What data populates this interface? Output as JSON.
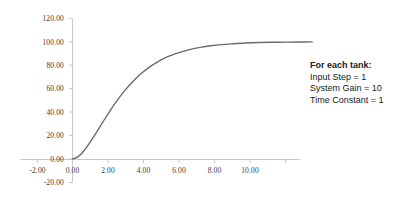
{
  "chart_data": {
    "type": "line",
    "title": "",
    "subtitle": "",
    "xlabel": "",
    "ylabel": "",
    "xlim": [
      -2.0,
      10.0
    ],
    "ylim": [
      -20.0,
      120.0
    ],
    "grid": false,
    "legend": null,
    "x_ticks": [
      -2.0,
      0.0,
      2.0,
      4.0,
      6.0,
      8.0,
      10.0
    ],
    "x_tick_labels": [
      "-2.00",
      "0.00",
      "2.00",
      "4.00",
      "6.00",
      "8.00",
      "10.00"
    ],
    "y_ticks": [
      -20.0,
      0.0,
      20.0,
      40.0,
      60.0,
      80.0,
      100.0,
      120.0
    ],
    "y_tick_labels": [
      "-20.00",
      "0.00",
      "20.00",
      "40.00",
      "60.00",
      "80.00",
      "100.00",
      "120.00"
    ],
    "series": [
      {
        "name": "step response",
        "color": "#6b6b6b",
        "x": [
          0.0,
          0.2,
          0.4,
          0.6,
          0.8,
          1.0,
          1.2,
          1.4,
          1.6,
          1.8,
          2.0,
          2.2,
          2.4,
          2.6,
          2.8,
          3.0,
          3.2,
          3.4,
          3.6,
          3.8,
          4.0,
          4.4,
          4.8,
          5.2,
          5.6,
          6.0,
          6.5,
          7.0,
          7.5,
          8.0,
          8.5,
          9.0
        ],
        "y": [
          0.0,
          0.18,
          0.62,
          1.23,
          1.91,
          2.64,
          3.37,
          4.08,
          4.75,
          5.37,
          5.94,
          6.45,
          6.92,
          7.33,
          7.69,
          8.01,
          8.29,
          8.54,
          8.75,
          8.93,
          9.08,
          9.33,
          9.52,
          9.66,
          9.76,
          9.83,
          9.9,
          9.94,
          9.96,
          9.97,
          9.98,
          9.99
        ],
        "y_scale": 10,
        "description": "Third-order overdamped tank step response rising from 0 to 100"
      }
    ],
    "annotation": {
      "title": "For each tank:",
      "lines": [
        "Input Step = 1",
        "System Gain = 10",
        "Time Constant = 1"
      ]
    },
    "axis_color": "#c4c4c4",
    "text_color": "#3a3a3a"
  }
}
